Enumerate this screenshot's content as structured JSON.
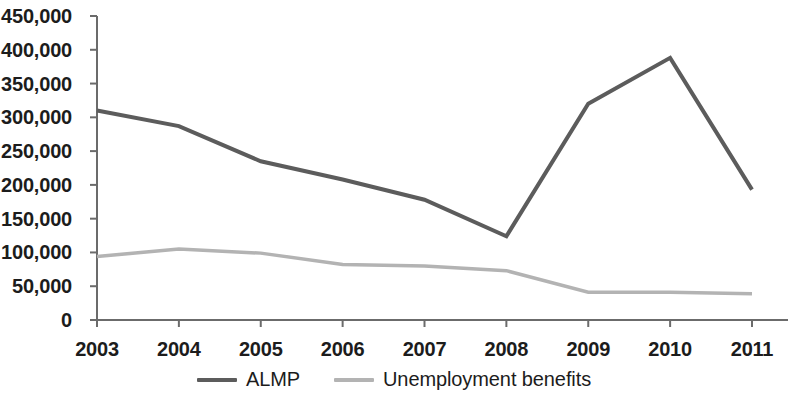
{
  "chart_data": {
    "type": "line",
    "title": "",
    "subtitle": "",
    "xlabel": "",
    "ylabel": "",
    "categories": [
      "2003",
      "2004",
      "2005",
      "2006",
      "2007",
      "2008",
      "2009",
      "2010",
      "2011"
    ],
    "series": [
      {
        "name": "ALMP",
        "color": "#5c5c5c",
        "values": [
          310000,
          287000,
          235000,
          208000,
          178000,
          124000,
          320000,
          388000,
          193000
        ]
      },
      {
        "name": "Unemployment benefits",
        "color": "#b3b3b3",
        "values": [
          94000,
          105000,
          99000,
          82000,
          80000,
          73000,
          41000,
          41000,
          39000
        ]
      }
    ],
    "ylim": [
      0,
      450000
    ],
    "ytick_step": 50000,
    "ytick_labels": [
      "0",
      "50,000",
      "100,000",
      "150,000",
      "200,000",
      "250,000",
      "300,000",
      "350,000",
      "400,000",
      "450,000"
    ],
    "xtick_labels": [
      "2003",
      "2004",
      "2005",
      "2006",
      "2007",
      "2008",
      "2009",
      "2010",
      "2011"
    ],
    "grid": false,
    "legend_position": "bottom",
    "axis_color": "#6b6b6b"
  },
  "legend": {
    "items": [
      {
        "label": "ALMP",
        "color": "#5c5c5c"
      },
      {
        "label": "Unemployment benefits",
        "color": "#b3b3b3"
      }
    ]
  }
}
